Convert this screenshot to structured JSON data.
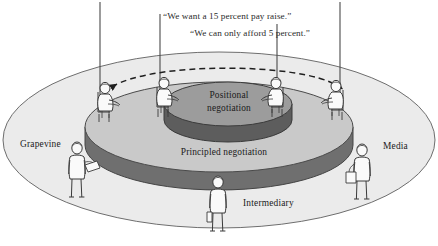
{
  "figure": {
    "background_color": "#ffffff"
  },
  "quotes": [
    {
      "id": "quote-demand",
      "text": "“We want a 15 percent pay raise.”",
      "x": 163,
      "y": 19,
      "anchor": "start"
    },
    {
      "id": "quote-offer",
      "text": "“We can only afford 5 percent.”",
      "x": 190,
      "y": 36,
      "anchor": "start"
    }
  ],
  "labels": {
    "inner_disc": {
      "line1": "Positional",
      "line2": "negotiation",
      "x": 229,
      "y1": 97,
      "y2": 110,
      "color": "#1b1b1b"
    },
    "outer_disc": {
      "text": "Principled negotiation",
      "x": 224,
      "y": 154,
      "color": "#1b1b1b"
    },
    "grapevine": {
      "text": "Grapevine",
      "x": 20,
      "y": 146,
      "color": "#1b1b1b"
    },
    "media": {
      "text": "Media",
      "x": 383,
      "y": 148,
      "color": "#1b1b1b"
    },
    "intermediary": {
      "text": "Intermediary",
      "x": 243,
      "y": 205,
      "color": "#1b1b1b"
    }
  },
  "colors": {
    "outer_plane_fill": "#ebebeb",
    "outer_plane_stroke": "#707070",
    "mid_disc_top_fill": "#c8c8c8",
    "mid_disc_side_fill": "#6f6f6f",
    "mid_disc_stroke": "#4a4a4a",
    "inner_disc_top_fill": "#9c9c9c",
    "inner_disc_side_fill": "#5c5c5c",
    "inner_disc_stroke": "#3c3c3c",
    "figure_fill": "#fafafa",
    "figure_stroke": "#3a3a3a",
    "line_stroke": "#4a4a4a",
    "dashed_arrow_stroke": "#1f1f1f",
    "text_color": "#1b1b1b"
  },
  "geometry": {
    "outer_plane": {
      "cx": 219,
      "cy": 140,
      "rx": 216,
      "ry": 88
    },
    "mid_disc": {
      "cx": 219,
      "cy": 127,
      "rx": 134,
      "ry": 45,
      "depth": 18
    },
    "inner_disc": {
      "cx": 228,
      "cy": 104,
      "rx": 64,
      "ry": 22,
      "depth": 16
    }
  },
  "vertical_lines": [
    {
      "id": "line-far-left",
      "x": 100,
      "y_top": 2,
      "y_bottom": 112
    },
    {
      "id": "line-mid-left",
      "x": 160,
      "y_top": 14,
      "y_bottom": 100
    },
    {
      "id": "line-mid-right",
      "x": 277,
      "y_top": 24,
      "y_bottom": 100
    },
    {
      "id": "line-far-right",
      "x": 340,
      "y_top": 2,
      "y_bottom": 108
    }
  ],
  "dashed_arc": {
    "path": "M 112 87 C 150 62, 300 62, 338 86",
    "stroke_dasharray": "6 4",
    "arrow_left": {
      "x": 112,
      "y": 87
    },
    "arrow_right": {
      "x": 338,
      "y": 86
    }
  },
  "seated_figures": [
    {
      "id": "seated-far-left",
      "x": 105,
      "y": 88,
      "facing": "right"
    },
    {
      "id": "seated-mid-left",
      "x": 164,
      "y": 83,
      "facing": "right"
    },
    {
      "id": "seated-mid-right",
      "x": 276,
      "y": 83,
      "facing": "left"
    },
    {
      "id": "seated-far-right",
      "x": 336,
      "y": 86,
      "facing": "left"
    }
  ],
  "standing_figures": [
    {
      "id": "standing-grapevine",
      "x": 77,
      "y": 148,
      "label": "Grapevine"
    },
    {
      "id": "standing-intermediary",
      "x": 218,
      "y": 182,
      "label": "Intermediary"
    },
    {
      "id": "standing-media",
      "x": 362,
      "y": 150,
      "label": "Media"
    }
  ]
}
